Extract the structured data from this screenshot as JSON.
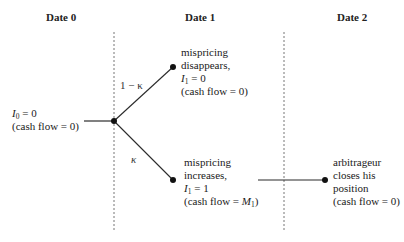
{
  "headers": {
    "date0": "Date 0",
    "date1": "Date 1",
    "date2": "Date 2"
  },
  "root": {
    "var": "I",
    "sub": "0",
    "eq": " = 0",
    "cash": "(cash flow = 0)"
  },
  "branches": {
    "up_prob": "1 − κ",
    "down_prob": "κ"
  },
  "upper_node": {
    "line1": "mispricing",
    "line2": "disappears,",
    "var": "I",
    "sub": "1",
    "eq": " = 0",
    "cash": "(cash flow = 0)"
  },
  "lower_node": {
    "line1": "mispricing",
    "line2": "increases,",
    "var": "I",
    "sub": "1",
    "eq": " = 1",
    "cash_prefix": "(cash flow = ",
    "cash_var": "M",
    "cash_sub": "1",
    "cash_suffix": ")"
  },
  "final_node": {
    "line1": "arbitrageur",
    "line2": "closes his",
    "line3": "position",
    "cash": "(cash flow = 0)"
  },
  "colors": {
    "line": "#2a2a2a",
    "dash": "#666666",
    "node": "#111111"
  }
}
